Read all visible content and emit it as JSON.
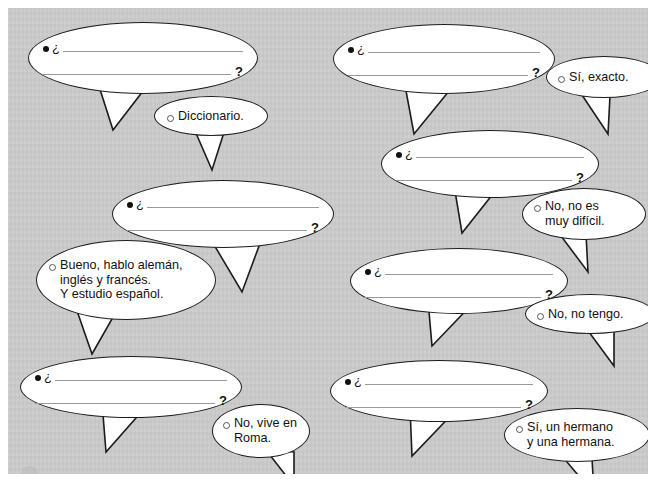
{
  "page": {
    "background_color": "#c9c9c9",
    "margin_color": "#ffffff",
    "ink_color": "#1c1c1c",
    "rule_color": "#9a9a9a"
  },
  "markers": {
    "question_bullet": "filled-dot",
    "answer_bullet": "hollow-circle",
    "inverted_question": "¿",
    "question_mark": "?"
  },
  "ghost_text": {
    "line_a": "",
    "line_b": ""
  },
  "exercises": [
    {
      "id": 1,
      "question": {
        "prompt_start": "¿",
        "prompt_end": "?",
        "blank_lines": 2
      },
      "answer": {
        "text": "Diccionario."
      }
    },
    {
      "id": 2,
      "question": {
        "prompt_start": "¿",
        "prompt_end": "?",
        "blank_lines": 2
      },
      "answer": {
        "text": "Sí, exacto."
      }
    },
    {
      "id": 3,
      "question": {
        "prompt_start": "¿",
        "prompt_end": "?",
        "blank_lines": 2
      },
      "answer": {
        "text": "No, no es\nmuy difícil."
      }
    },
    {
      "id": 4,
      "question": {
        "prompt_start": "¿",
        "prompt_end": "?",
        "blank_lines": 2
      },
      "answer": {
        "text": "Bueno, hablo alemán,\ninglés y francés.\nY estudio español."
      }
    },
    {
      "id": 5,
      "question": {
        "prompt_start": "¿",
        "prompt_end": "?",
        "blank_lines": 2
      },
      "answer": {
        "text": "No, no tengo."
      }
    },
    {
      "id": 6,
      "question": {
        "prompt_start": "¿",
        "prompt_end": "?",
        "blank_lines": 2
      },
      "answer": {
        "text": "No, vive en\nRoma."
      }
    },
    {
      "id": 7,
      "question": {
        "prompt_start": "¿",
        "prompt_end": "?",
        "blank_lines": 2
      },
      "answer": {
        "text": "Sí, un hermano\ny una hermana."
      }
    }
  ]
}
